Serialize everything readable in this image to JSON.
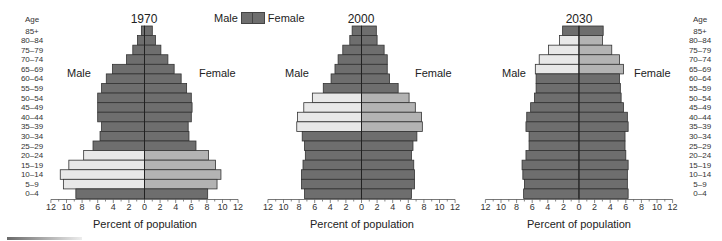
{
  "legend": {
    "male_label": "Male",
    "female_label": "Female"
  },
  "age_header": "Age",
  "age_groups": [
    "85+",
    "80–84",
    "75–79",
    "70–74",
    "65–69",
    "60–64",
    "55–59",
    "50–54",
    "45–49",
    "40–44",
    "35–39",
    "30–34",
    "25–29",
    "20–24",
    "15–19",
    "10–14",
    "5–9",
    "0–4"
  ],
  "x_ticks": [
    "12",
    "10",
    "8",
    "6",
    "4",
    "2",
    "0",
    "2",
    "4",
    "6",
    "8",
    "10",
    "12"
  ],
  "colors": {
    "dark": "#6e6e6e",
    "light_male": "#e8e8e8",
    "light_female": "#b3b3b3",
    "axis": "#222222",
    "outline": "#333333"
  },
  "charts": [
    {
      "title": "1970",
      "male_label": "Male",
      "female_label": "Female",
      "xlabel": "Percent of population"
    },
    {
      "title": "2000",
      "male_label": "Male",
      "female_label": "Female",
      "xlabel": "Percent of population"
    },
    {
      "title": "2030",
      "male_label": "Male",
      "female_label": "Female",
      "xlabel": "Percent of population"
    }
  ],
  "chart_data": [
    {
      "type": "bar",
      "subtype": "population-pyramid",
      "title": "1970",
      "xlabel": "Percent of population",
      "ylabel": "Age",
      "xlim": [
        -12,
        12
      ],
      "categories": [
        "85+",
        "80–84",
        "75–79",
        "70–74",
        "65–69",
        "60–64",
        "55–59",
        "50–54",
        "45–49",
        "40–44",
        "35–39",
        "30–34",
        "25–29",
        "20–24",
        "15–19",
        "10–14",
        "5–9",
        "0–4"
      ],
      "series": [
        {
          "name": "Male",
          "values": [
            0.4,
            0.9,
            1.5,
            2.3,
            4.1,
            4.9,
            5.5,
            6.0,
            6.0,
            6.0,
            5.5,
            5.7,
            6.6,
            7.8,
            9.7,
            10.8,
            10.4,
            8.8
          ]
        },
        {
          "name": "Female",
          "values": [
            1.0,
            1.4,
            2.1,
            3.0,
            3.8,
            4.7,
            5.4,
            6.0,
            6.1,
            6.0,
            5.6,
            5.7,
            6.6,
            8.2,
            9.1,
            9.8,
            9.3,
            8.1
          ]
        }
      ],
      "highlighted_groups": [
        "20–24",
        "15–19",
        "10–14",
        "5–9"
      ],
      "legend": [
        "Male",
        "Female"
      ]
    },
    {
      "type": "bar",
      "subtype": "population-pyramid",
      "title": "2000",
      "xlabel": "Percent of population",
      "ylabel": "Age",
      "xlim": [
        -12,
        12
      ],
      "categories": [
        "85+",
        "80–84",
        "75–79",
        "70–74",
        "65–69",
        "60–64",
        "55–59",
        "50–54",
        "45–49",
        "40–44",
        "35–39",
        "30–34",
        "25–29",
        "20–24",
        "15–19",
        "10–14",
        "5–9",
        "0–4"
      ],
      "series": [
        {
          "name": "Male",
          "values": [
            1.2,
            1.5,
            2.4,
            3.0,
            3.4,
            3.9,
            4.9,
            6.3,
            7.4,
            8.2,
            8.3,
            7.6,
            7.3,
            7.2,
            7.5,
            7.7,
            7.7,
            7.3
          ]
        },
        {
          "name": "Female",
          "values": [
            1.9,
            2.0,
            2.9,
            3.3,
            3.3,
            3.6,
            4.7,
            6.1,
            6.9,
            7.7,
            7.8,
            7.1,
            6.6,
            6.4,
            6.7,
            6.8,
            6.8,
            6.4
          ]
        }
      ],
      "highlighted_groups": [
        "50–54",
        "45–49",
        "40–44",
        "35–39"
      ],
      "legend": [
        "Male",
        "Female"
      ]
    },
    {
      "type": "bar",
      "subtype": "population-pyramid",
      "title": "2030",
      "xlabel": "Percent of population",
      "ylabel": "Age",
      "xlim": [
        -12,
        12
      ],
      "categories": [
        "85+",
        "80–84",
        "75–79",
        "70–74",
        "65–69",
        "60–64",
        "55–59",
        "50–54",
        "45–49",
        "40–44",
        "35–39",
        "30–34",
        "25–29",
        "20–24",
        "15–19",
        "10–14",
        "5–9",
        "0–4"
      ],
      "series": [
        {
          "name": "Male",
          "values": [
            2.1,
            2.5,
            3.9,
            5.1,
            5.6,
            5.5,
            5.5,
            5.7,
            6.2,
            6.7,
            6.8,
            6.4,
            6.4,
            6.8,
            7.3,
            7.2,
            7.0,
            7.1
          ]
        },
        {
          "name": "Female",
          "values": [
            3.1,
            3.0,
            4.2,
            5.2,
            5.7,
            5.2,
            5.3,
            5.4,
            5.7,
            6.2,
            6.3,
            5.9,
            5.9,
            6.0,
            6.3,
            6.2,
            6.2,
            6.3
          ]
        }
      ],
      "highlighted_groups": [
        "80–84",
        "75–79",
        "70–74",
        "65–69"
      ],
      "legend": [
        "Male",
        "Female"
      ]
    }
  ]
}
